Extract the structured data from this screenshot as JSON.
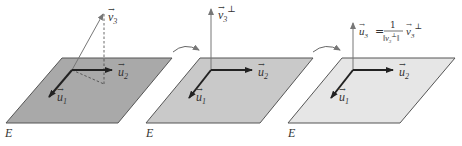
{
  "colors": {
    "plane1": "#a9a9a9",
    "plane2": "#c9c9c9",
    "plane3": "#e6e6e6",
    "edge": "#555555",
    "vector": "#222222",
    "thin": "#777777"
  },
  "panels": [
    {
      "plane_label": "E",
      "u1": "u",
      "u1_sub": "1",
      "u2": "u",
      "u2_sub": "2",
      "v3": "v",
      "v3_sub": "3"
    },
    {
      "plane_label": "E",
      "u1": "u",
      "u1_sub": "1",
      "u2": "u",
      "u2_sub": "2",
      "v3perp": "v",
      "v3perp_sub": "3",
      "v3perp_sup": "⊥"
    },
    {
      "plane_label": "E",
      "u1": "u",
      "u1_sub": "1",
      "u2": "u",
      "u2_sub": "2",
      "u3": "u",
      "u3_sub": "3",
      "equals": "=",
      "numerator": "1",
      "denominator": "‖v",
      "denominator_sub": "3",
      "denominator_sup": "⊥",
      "denominator_close": "‖",
      "rhs": "v",
      "rhs_sub": "3",
      "rhs_sup": "⊥"
    }
  ]
}
